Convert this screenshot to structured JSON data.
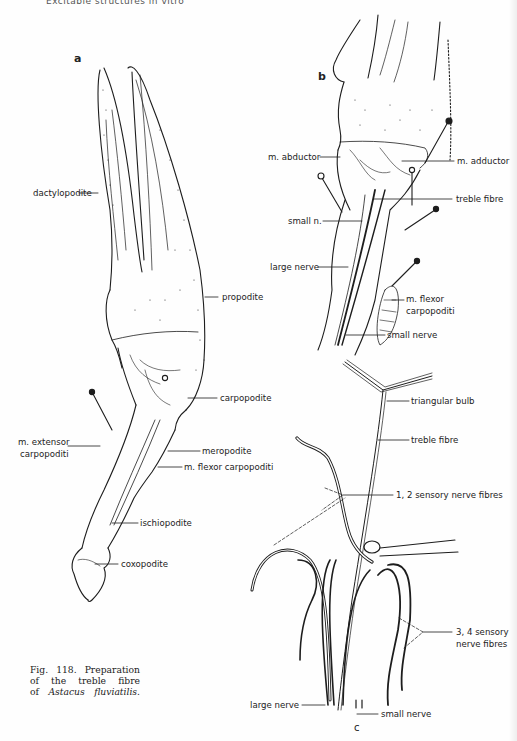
{
  "page": {
    "running_head": "Excitable structures in vitro"
  },
  "figure": {
    "number": "Fig. 118.",
    "caption_lines": [
      "Fig. 118. Preparation",
      "of the treble fibre",
      "of"
    ],
    "caption_species": "Astacus fluviatilis.",
    "caption_full": "Fig. 118. Preparation of the treble fibre of Astacus fluviatilis."
  },
  "panels": {
    "a": {
      "letter": "a",
      "labels": {
        "dactylopodite": "dactylopodite",
        "propodite": "propodite",
        "carpopodite": "carpopodite",
        "m_extensor_1": "m. extensor",
        "m_extensor_2": "carpopoditi",
        "meropodite": "meropodite",
        "m_flexor": "m. flexor carpopoditi",
        "ischiopodite": "ischiopodite",
        "coxopodite": "coxopodite"
      }
    },
    "b": {
      "letter": "b",
      "labels": {
        "m_abductor": "m. abductor",
        "m_adductor": "m. adductor",
        "treble_fibre": "treble fibre",
        "small_n": "small n.",
        "large_nerve": "large nerve",
        "m_flexor_1": "m. flexor",
        "m_flexor_2": "carpopoditi",
        "small_nerve": "small nerve"
      }
    },
    "c": {
      "letter": "c",
      "labels": {
        "triangular_bulb": "triangular bulb",
        "treble_fibre": "treble fibre",
        "sensory_12": "1, 2 sensory nerve fibres",
        "sensory_34_1": "3, 4 sensory",
        "sensory_34_2": "nerve fibres",
        "large_nerve": "large nerve",
        "small_nerve": "small nerve"
      }
    }
  }
}
